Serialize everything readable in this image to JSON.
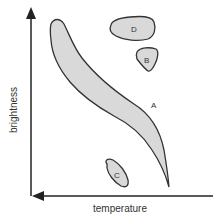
{
  "diagram": {
    "type": "Hertzsprung-Russell style region diagram",
    "axes": {
      "x_label": "temperature",
      "y_label": "brightness",
      "x_arrow_direction": "left",
      "y_arrow_direction": "up"
    },
    "regions": [
      {
        "id": "A",
        "label": "A",
        "shape": "long curved band from upper-left to lower-right"
      },
      {
        "id": "B",
        "label": "B",
        "shape": "small rounded triangle, upper right"
      },
      {
        "id": "C",
        "label": "C",
        "shape": "small tilted oval, lower middle"
      },
      {
        "id": "D",
        "label": "D",
        "shape": "horizontal oval, top right"
      }
    ],
    "colors": {
      "fill": "#d9d9d9",
      "stroke": "#333333",
      "axis": "#222222"
    }
  }
}
